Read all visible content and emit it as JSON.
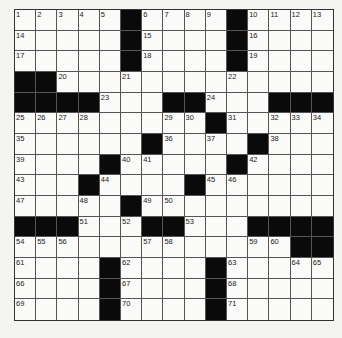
{
  "puzzle": {
    "rows": 15,
    "cols": 15,
    "colors": {
      "black": "#0a0a0a",
      "white": "#fafaf8",
      "line": "#555555"
    },
    "layout": [
      "11111011110ed11",
      "11111011110111 1",
      "111110111101111",
      "001111111101111",
      "000011100111000",
      "111111111011111",
      "111111011101111",
      "111101111101111",
      "111011110111111",
      "111110111111111",
      "000111001110000",
      "111111111111100",
      "111101111011111",
      "111101111011111",
      "111101111011111"
    ],
    "grid": [
      [
        "1",
        "2",
        "3",
        "4",
        "5",
        "#",
        "6",
        "7",
        "8",
        "9",
        "#",
        "10",
        "11",
        "12",
        "13"
      ],
      [
        "14",
        "",
        "",
        "",
        "",
        "#",
        "15",
        "",
        "",
        "",
        "#",
        "16",
        "",
        "",
        ""
      ],
      [
        "17",
        "",
        "",
        "",
        "",
        "#",
        "18",
        "",
        "",
        "",
        "#",
        "19",
        "",
        "",
        ""
      ],
      [
        "#",
        "#",
        "20",
        "",
        "",
        "21",
        "",
        "",
        "",
        "",
        "22",
        "",
        "",
        "",
        ""
      ],
      [
        "#",
        "#",
        "#",
        "#",
        "23",
        "",
        "",
        "#",
        "#",
        "24",
        "",
        "",
        "#",
        "#",
        "#"
      ],
      [
        "25",
        "26",
        "27",
        "28",
        "",
        "",
        "",
        "29",
        "30",
        "#",
        "31",
        "",
        "32",
        "33",
        "34"
      ],
      [
        "35",
        "",
        "",
        "",
        "",
        "",
        "#",
        "36",
        "",
        "37",
        "",
        "#",
        "38",
        "",
        ""
      ],
      [
        "39",
        "",
        "",
        "",
        "#",
        "40",
        "41",
        "",
        "",
        "",
        "#",
        "42",
        "",
        "",
        ""
      ],
      [
        "43",
        "",
        "",
        "#",
        "44",
        "",
        "",
        "",
        "#",
        "45",
        "46",
        "",
        "",
        "",
        ""
      ],
      [
        "47",
        "",
        "",
        "48",
        "",
        "#",
        "49",
        "50",
        "",
        "",
        "",
        "",
        "",
        "",
        ""
      ],
      [
        "#",
        "#",
        "#",
        "51",
        "",
        "52",
        "#",
        "#",
        "53",
        "",
        "",
        "#",
        "#",
        "#",
        "#"
      ],
      [
        "54",
        "55",
        "56",
        "",
        "",
        "",
        "57",
        "58",
        "",
        "",
        "",
        "59",
        "60",
        "#",
        "#"
      ],
      [
        "61",
        "",
        "",
        "",
        "#",
        "62",
        "",
        "",
        "",
        "#",
        "63",
        "",
        "",
        "64",
        "65"
      ],
      [
        "66",
        "",
        "",
        "",
        "#",
        "67",
        "",
        "",
        "",
        "#",
        "68",
        "",
        "",
        "",
        ""
      ],
      [
        "69",
        "",
        "",
        "",
        "#",
        "70",
        "",
        "",
        "",
        "#",
        "71",
        "",
        "",
        "",
        ""
      ]
    ]
  }
}
